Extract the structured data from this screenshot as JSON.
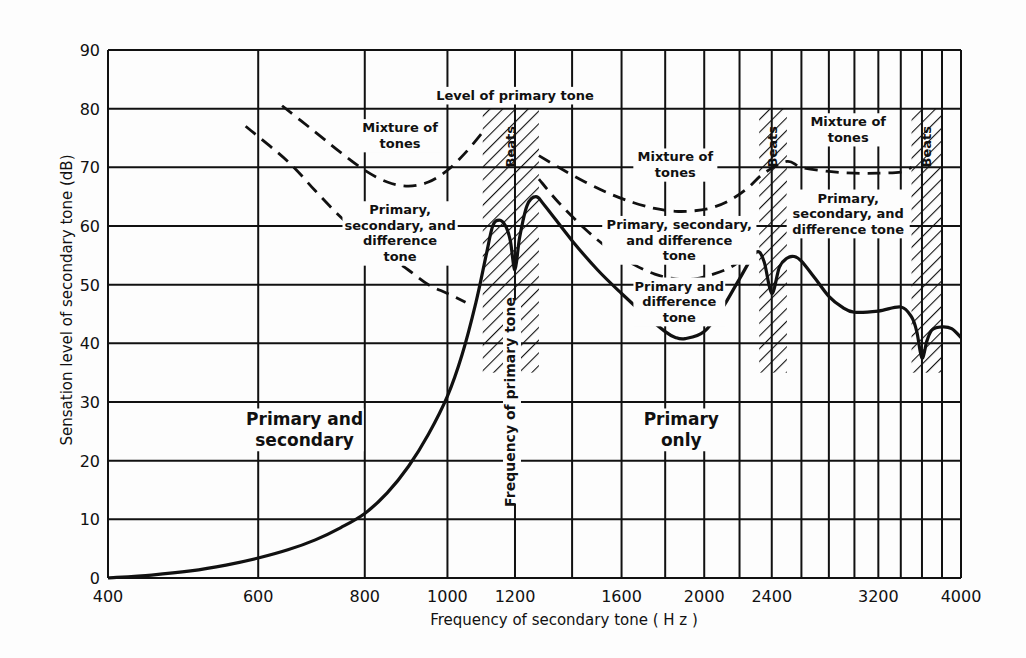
{
  "chart_data": {
    "type": "line",
    "title": "",
    "xlabel": "Frequency of secondary tone ( H z )",
    "ylabel": "Sensation level of secondary tone (dB)",
    "xscale": "log",
    "xlim": [
      400,
      4000
    ],
    "ylim": [
      0,
      90
    ],
    "grid": true,
    "x_ticks": [
      400,
      600,
      800,
      1000,
      1200,
      1600,
      2000,
      2400,
      3200,
      4000
    ],
    "x_tick_labels": [
      "400",
      "600",
      "800",
      "1000",
      "1200",
      "1600",
      "2000",
      "2400",
      "3200",
      "4000"
    ],
    "x_gridlines": [
      600,
      800,
      1000,
      1200,
      1400,
      1600,
      1800,
      2000,
      2200,
      2400,
      2600,
      2800,
      3000,
      3200,
      3400,
      3600,
      3800,
      4000
    ],
    "y_ticks": [
      0,
      10,
      20,
      30,
      40,
      50,
      60,
      70,
      80,
      90
    ],
    "series": [
      {
        "name": "Threshold of secondary tone (solid)",
        "style": "solid",
        "x": [
          400,
          450,
          500,
          550,
          600,
          650,
          700,
          750,
          800,
          850,
          900,
          950,
          1000,
          1040,
          1080,
          1110,
          1130,
          1150,
          1170,
          1185,
          1200,
          1215,
          1240,
          1270,
          1300,
          1400,
          1500,
          1600,
          1700,
          1800,
          1850,
          1900,
          2000,
          2100,
          2200,
          2300,
          2350,
          2400,
          2450,
          2500,
          2550,
          2600,
          2700,
          2800,
          2900,
          3000,
          3200,
          3400,
          3500,
          3550,
          3600,
          3650,
          3700,
          3800,
          3900,
          4000
        ],
        "y": [
          0,
          0.5,
          1.2,
          2.2,
          3.4,
          4.8,
          6.5,
          8.6,
          11,
          14.5,
          19,
          24.5,
          31,
          38,
          47,
          55,
          60,
          61,
          60,
          57.5,
          52.5,
          58,
          63.5,
          65,
          63.5,
          57.5,
          52.5,
          48.5,
          45,
          42,
          41,
          40.8,
          42,
          46,
          51,
          55.5,
          54,
          48.5,
          53,
          54.5,
          54.8,
          54,
          51,
          48,
          46.2,
          45.3,
          45.5,
          46.2,
          44.5,
          42,
          37.5,
          40.5,
          42.3,
          42.8,
          42.5,
          41
        ]
      },
      {
        "name": "Lower dashed boundary (Primary, secondary, and difference tone)",
        "style": "dashed",
        "x": [
          580,
          650,
          700,
          750,
          800,
          850,
          900,
          950,
          1000,
          1050
        ],
        "y": [
          77,
          71,
          66,
          61.5,
          58,
          55,
          52.5,
          50,
          48.5,
          47
        ]
      },
      {
        "name": "Upper dashed boundary left (Mixture of tones)",
        "style": "dashed",
        "x": [
          640,
          700,
          750,
          800,
          850,
          900,
          950,
          1000,
          1050,
          1100
        ],
        "y": [
          80.5,
          76,
          72.5,
          69.5,
          67.5,
          66.8,
          67.5,
          69.5,
          72.5,
          76
        ]
      },
      {
        "name": "Upper dashed boundary right (Mixture of tones)",
        "style": "dashed",
        "x": [
          1280,
          1350,
          1450,
          1550,
          1650,
          1750,
          1850,
          1950,
          2050,
          2150,
          2250,
          2350,
          2500,
          2600,
          2800,
          3000,
          3200,
          3400,
          3500
        ],
        "y": [
          72,
          70,
          67.5,
          65.5,
          64,
          63,
          62.5,
          62.6,
          63.2,
          64.5,
          66.5,
          69,
          71,
          70,
          69.3,
          69,
          69,
          69.2,
          70
        ]
      },
      {
        "name": "Lower dashed boundary right (Primary and difference tone)",
        "style": "dashed",
        "x": [
          1280,
          1350,
          1450,
          1550,
          1650,
          1750,
          1850,
          1950,
          2050,
          2150,
          2250
        ],
        "y": [
          68,
          64,
          59.5,
          56,
          53.5,
          51.8,
          51,
          51,
          51.8,
          53,
          55
        ]
      }
    ],
    "hatched_regions": [
      {
        "label": "Beats",
        "x_from": 1100,
        "x_to": 1280,
        "y_top": 80
      },
      {
        "label": "Beats",
        "x_from": 2320,
        "x_to": 2500,
        "y_top": 80
      },
      {
        "label": "Beats",
        "x_from": 3500,
        "x_to": 3800,
        "y_top": 80
      }
    ],
    "annotations": [
      {
        "text": "Level of primary tone",
        "x": 1200,
        "y": 81.5
      },
      {
        "text": "Mixture of\ntones",
        "x": 880,
        "y": 76
      },
      {
        "text": "Primary,\nsecondary, and\ndifference\ntone",
        "x": 880,
        "y": 62
      },
      {
        "text": "Mixture of\ntones",
        "x": 1850,
        "y": 71
      },
      {
        "text": "Primary, secondary,\nand difference\ntone",
        "x": 1870,
        "y": 59.5
      },
      {
        "text": "Primary and\ndifference\ntone",
        "x": 1870,
        "y": 49
      },
      {
        "text": "Mixture of\ntones",
        "x": 2950,
        "y": 77
      },
      {
        "text": "Primary,\nsecondary, and\ndifference tone",
        "x": 2950,
        "y": 64
      },
      {
        "text": "Primary and\nsecondary",
        "x": 680,
        "y": 26
      },
      {
        "text": "Primary\nonly",
        "x": 1880,
        "y": 26
      },
      {
        "text": "Frequency of primary tone",
        "x": 1200,
        "y": 30,
        "rotate": -90
      }
    ]
  }
}
